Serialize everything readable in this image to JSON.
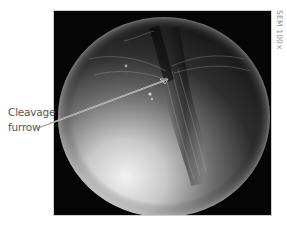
{
  "figure": {
    "labels": {
      "line1": "Cleavage",
      "line2": "furrow"
    },
    "scale_note": "SEM 100×",
    "colors": {
      "background": "#ffffff",
      "panel": "#050505",
      "label_text": "#555555",
      "scale_text": "#8a8a8a",
      "pointer": "#d8d8d8"
    }
  }
}
